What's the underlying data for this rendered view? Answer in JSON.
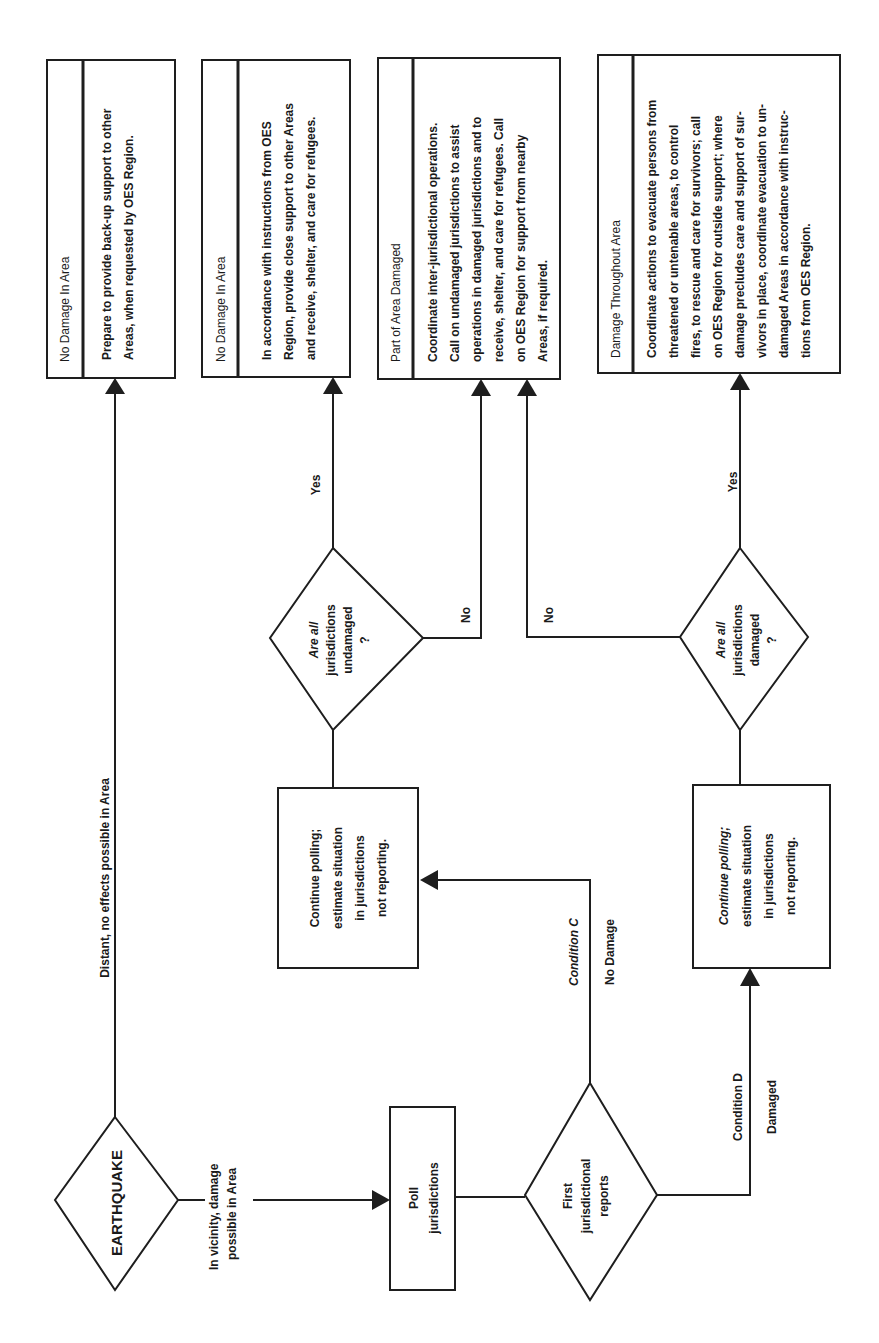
{
  "diagram": {
    "orientation": "rotated-90-ccw",
    "start": {
      "label": "EARTHQUAKE"
    },
    "edges": {
      "distant": "Distant, no effects possible in Area",
      "vicinity_line1": "In vicinity, damage",
      "vicinity_line2": "possible in Area",
      "condition_c": "Condition C",
      "no_damage": "No Damage",
      "condition_d": "Condition D",
      "damaged": "Damaged",
      "yes_undamaged": "Yes",
      "no_undamaged": "No",
      "yes_damaged": "Yes",
      "no_damaged": "No"
    },
    "poll": {
      "line1": "Poll",
      "line2": "jurisdictions"
    },
    "first_reports": {
      "line1": "First",
      "line2": "jurisdictional",
      "line3": "reports"
    },
    "continue_polling_c": {
      "line1": "Continue polling;",
      "line2": "estimate situation",
      "line3": "in jurisdictions",
      "line4": "not reporting."
    },
    "continue_polling_d": {
      "line1": "Continue polling;",
      "line2": "estimate situation",
      "line3": "in jurisdictions",
      "line4": "not reporting."
    },
    "decision_undamaged": {
      "line1": "Are all",
      "line2": "jurisdictions",
      "line3": "undamaged",
      "line4": "?"
    },
    "decision_damaged": {
      "line1": "Are all",
      "line2": "jurisdictions",
      "line3": "damaged",
      "line4": "?"
    },
    "outcomes": [
      {
        "title": "No Damage In Area",
        "lines": [
          "Prepare to provide back-up support to other",
          "Areas, when requested by OES Region."
        ]
      },
      {
        "title": "No Damage In Area",
        "lines": [
          "In accordance with instructions from OES",
          "Region, provide close support to other Areas",
          "and receive, shelter, and care for refugees."
        ]
      },
      {
        "title": "Part of Area Damaged",
        "lines": [
          "Coordinate inter-jurisdictional operations.",
          "Call on undamaged jurisdictions to assist",
          "operations in damaged jurisdictions and to",
          "receive, shelter, and care for refugees.  Call",
          "on OES Region for support from nearby",
          "Areas, if required."
        ]
      },
      {
        "title": "Damage Throughout Area",
        "lines": [
          "Coordinate actions to evacuate persons from",
          "threatened or untenable areas, to control",
          "fires, to rescue and care for survivors; call",
          "on OES Region for outside support; where",
          "damage precludes care and support of sur-",
          "vivors in place, coordinate evacuation to un-",
          "damaged Areas in accordance with instruc-",
          "tions from OES Region."
        ]
      }
    ]
  }
}
